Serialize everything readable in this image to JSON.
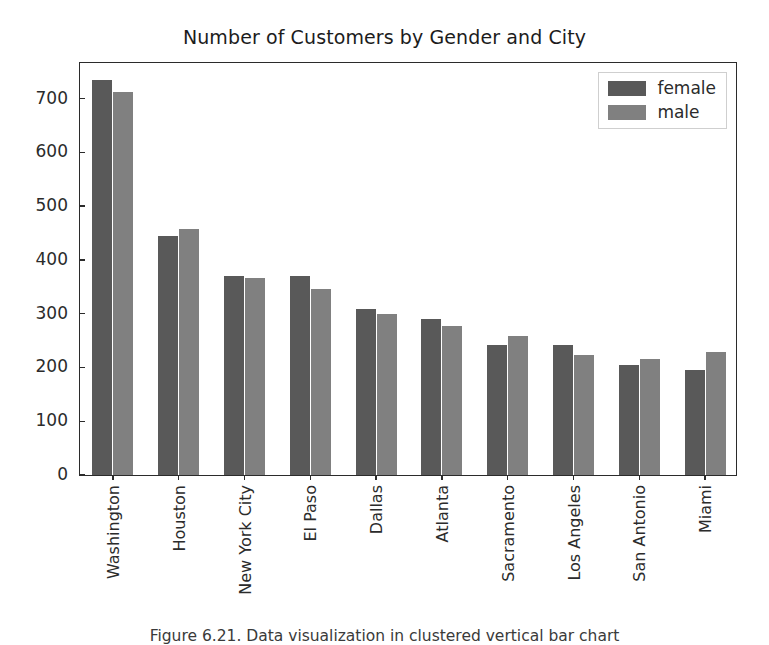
{
  "chart_data": {
    "type": "bar",
    "title": "Number of Customers by Gender and City",
    "xlabel": "",
    "ylabel": "",
    "categories": [
      "Washington",
      "Houston",
      "New York City",
      "El Paso",
      "Dallas",
      "Atlanta",
      "Sacramento",
      "Los Angeles",
      "San Antonio",
      "Miami"
    ],
    "series": [
      {
        "name": "female",
        "color": "#595959",
        "values": [
          735,
          445,
          370,
          371,
          309,
          291,
          241,
          241,
          205,
          195
        ]
      },
      {
        "name": "male",
        "color": "#808080",
        "values": [
          712,
          458,
          366,
          346,
          299,
          277,
          258,
          223,
          215,
          228
        ]
      }
    ],
    "ylim": [
      0,
      770
    ],
    "yticks": [
      0,
      100,
      200,
      300,
      400,
      500,
      600,
      700
    ],
    "ytick_labels": [
      "0",
      "100",
      "200",
      "300",
      "400",
      "500",
      "600",
      "700"
    ],
    "grid": false,
    "legend_position": "upper right",
    "legend_entries": [
      "female",
      "male"
    ]
  },
  "caption": "Figure 6.21. Data visualization in clustered vertical bar chart"
}
